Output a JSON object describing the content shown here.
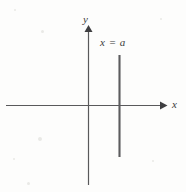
{
  "figure": {
    "type": "coordinate-diagram",
    "background_color": "#fdfdfc",
    "stroke_color": "#59595b",
    "text_color": "#3b3b3b",
    "labels": {
      "y_axis": "y",
      "x_axis": "x",
      "vertical_line": "x = a"
    }
  },
  "chart_data": {
    "type": "line",
    "title": "",
    "subtitle": "",
    "xlabel": "x",
    "ylabel": "y",
    "grid": false,
    "legend": "none",
    "annotations": [
      {
        "text": "x = a",
        "target": "vertical-line",
        "position": "above-right-of-line-top"
      }
    ],
    "axes": {
      "x_axis": {
        "label": "x",
        "arrow": "right",
        "origin_px": [
          88,
          105
        ],
        "start_px": [
          6,
          105
        ],
        "end_px": [
          167,
          105
        ]
      },
      "y_axis": {
        "label": "y",
        "arrow": "up",
        "origin_px": [
          88,
          105
        ],
        "start_px": [
          88,
          185
        ],
        "end_px": [
          88,
          26
        ]
      }
    },
    "series": [
      {
        "name": "x = a",
        "equation": "x = a",
        "orientation": "vertical",
        "x_px": 119,
        "y_top_px": 55,
        "y_bottom_px": 157,
        "values": [
          {
            "x": "a",
            "y": "top"
          },
          {
            "x": "a",
            "y": "bottom"
          }
        ]
      }
    ],
    "xlim": [
      "-",
      "+"
    ],
    "ylim": [
      "-",
      "+"
    ]
  },
  "specks": [
    {
      "x": 14,
      "y": 9,
      "size": 2
    },
    {
      "x": 41,
      "y": 30,
      "size": 3
    },
    {
      "x": 38,
      "y": 137,
      "size": 4
    },
    {
      "x": 13,
      "y": 158,
      "size": 2
    },
    {
      "x": 27,
      "y": 182,
      "size": 3
    },
    {
      "x": 160,
      "y": 18,
      "size": 2
    },
    {
      "x": 152,
      "y": 160,
      "size": 2
    }
  ]
}
